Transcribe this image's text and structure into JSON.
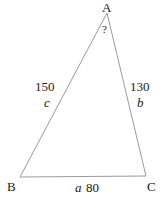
{
  "diagram": {
    "type": "triangle",
    "stroke_color": "#9a9a9a",
    "background_color": "#ffffff",
    "text_color": "#1a1a1a",
    "vertices": [
      {
        "name": "A",
        "label": "A",
        "x": 107,
        "y": 13
      },
      {
        "name": "B",
        "label": "B",
        "x": 20,
        "y": 177
      },
      {
        "name": "C",
        "label": "C",
        "x": 146,
        "y": 176
      }
    ],
    "angles": [
      {
        "at_vertex": "A",
        "label": "?",
        "known": false
      }
    ],
    "sides": [
      {
        "name": "a",
        "var_label": "a",
        "measure_label": "80",
        "between": "B-C",
        "position": "bottom"
      },
      {
        "name": "b",
        "var_label": "b",
        "measure_label": "130",
        "between": "A-C",
        "position": "right"
      },
      {
        "name": "c",
        "var_label": "c",
        "measure_label": "150",
        "between": "A-B",
        "position": "left"
      }
    ]
  }
}
